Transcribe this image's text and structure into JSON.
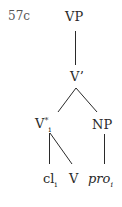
{
  "example_number": "57c",
  "nodes": {
    "vp": {
      "label": "VP"
    },
    "vbar": {
      "label": "V’"
    },
    "vstar": {
      "label": "V",
      "sup": "*",
      "sub": "i"
    },
    "np": {
      "label": "NP"
    },
    "cl": {
      "label": "cl",
      "sub": "i"
    },
    "v": {
      "label": "V"
    },
    "pro": {
      "label": "pro",
      "sub": "i"
    }
  },
  "edges": [
    [
      "VP",
      "V’"
    ],
    [
      "V’",
      "V*i"
    ],
    [
      "V’",
      "NP"
    ],
    [
      "V*i",
      "cli"
    ],
    [
      "V*i",
      "V"
    ],
    [
      "NP",
      "proi"
    ]
  ],
  "colors": {
    "ink": "#2a2a2a",
    "background": "#ffffff"
  }
}
